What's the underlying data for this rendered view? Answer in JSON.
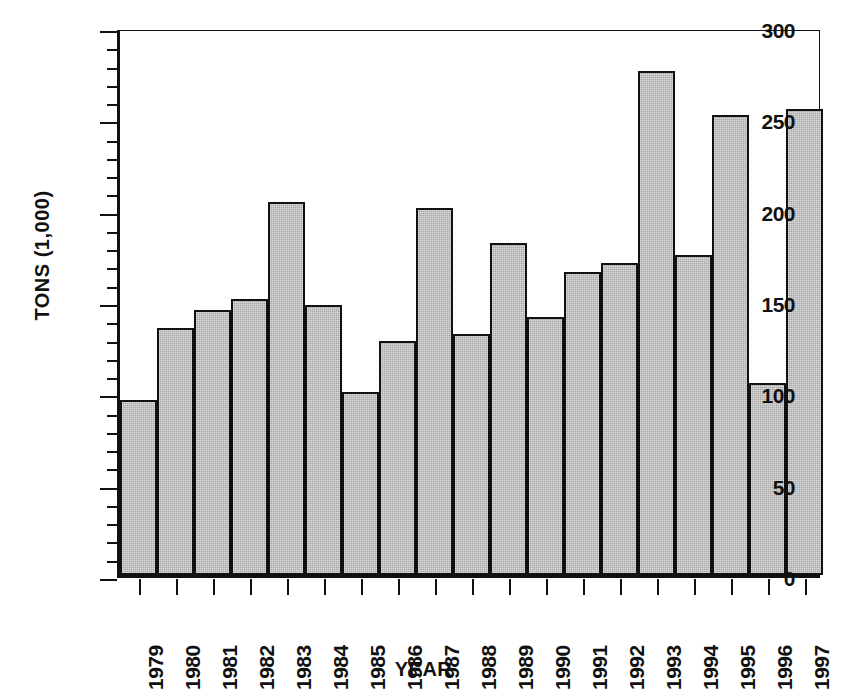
{
  "chart_data": {
    "type": "bar",
    "title": "",
    "xlabel": "YEAR",
    "ylabel": "TONS (1,000)",
    "ylim": [
      0,
      300
    ],
    "ytick_labels": [
      "0",
      "50",
      "100",
      "150",
      "200",
      "250",
      "300"
    ],
    "ytick_values": [
      0,
      50,
      100,
      150,
      200,
      250,
      300
    ],
    "minor_tick_step": 10,
    "grid": false,
    "legend": null,
    "categories": [
      "1979",
      "1980",
      "1981",
      "1982",
      "1983",
      "1984",
      "1985",
      "1986",
      "1987",
      "1988",
      "1989",
      "1990",
      "1991",
      "1992",
      "1993",
      "1994",
      "1995",
      "1996",
      "1997"
    ],
    "values": [
      96,
      135,
      145,
      151,
      204,
      148,
      100,
      128,
      201,
      132,
      182,
      141,
      166,
      171,
      276,
      175,
      252,
      105,
      255
    ],
    "bar_fill_color": "#a8a8a8",
    "bar_edge_color": "#111111",
    "axis_color": "#111111",
    "background_color": "#ffffff"
  }
}
